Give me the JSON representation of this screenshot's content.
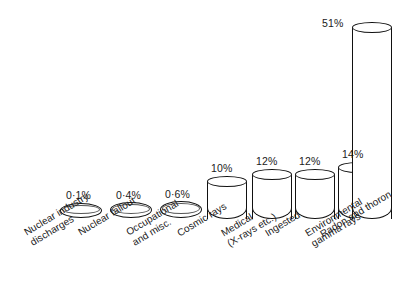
{
  "chart_data": {
    "type": "bar",
    "title": "",
    "subtitle": "",
    "xlabel": "",
    "ylabel": "",
    "ylim": [
      0,
      55
    ],
    "grid": false,
    "legend": "none",
    "value_suffix": "%",
    "categories": [
      "Nuclear industry\ndischarges",
      "Nuclear fallout",
      "Occupational\nand misc.",
      "Cosmic rays",
      "Medical\n(X-rays etc.)",
      "Ingested",
      "Environmental\ngamma rays",
      "Radon and thoron"
    ],
    "values": [
      0.1,
      0.4,
      0.6,
      10,
      12,
      12,
      14,
      51
    ],
    "value_labels": [
      "0·1%",
      "0·4%",
      "0·6%",
      "10%",
      "12%",
      "12%",
      "14%",
      "51%"
    ],
    "style": {
      "bar_shape": "cylinder",
      "fill_color": "#ffffff",
      "outline_color": "#111111",
      "background_color": "#ffffff"
    }
  },
  "bars": [
    {
      "label": "0·1%",
      "category": "Nuclear industry\ndischarges",
      "value": 0.1,
      "x": 60,
      "width": 42,
      "top": 203,
      "bottom": 218,
      "flat": true,
      "value_x": 66,
      "value_y": 190,
      "cat_x": 22,
      "cat_y": 228
    },
    {
      "label": "0·4%",
      "category": "Nuclear fallout",
      "value": 0.4,
      "x": 110,
      "width": 42,
      "top": 202,
      "bottom": 218,
      "flat": true,
      "value_x": 116,
      "value_y": 190,
      "cat_x": 76,
      "cat_y": 228
    },
    {
      "label": "0·6%",
      "category": "Occupational\nand misc.",
      "value": 0.6,
      "x": 160,
      "width": 42,
      "top": 201,
      "bottom": 218,
      "flat": true,
      "value_x": 165,
      "value_y": 189,
      "cat_x": 124,
      "cat_y": 228
    },
    {
      "label": "10%",
      "category": "Cosmic rays",
      "value": 10,
      "x": 207,
      "width": 40,
      "top": 176,
      "bottom": 219,
      "flat": false,
      "value_x": 211,
      "value_y": 163,
      "cat_x": 175,
      "cat_y": 229
    },
    {
      "label": "12%",
      "category": "Medical\n(X-rays etc.)",
      "value": 12,
      "x": 252,
      "width": 40,
      "top": 169,
      "bottom": 219,
      "flat": false,
      "value_x": 256,
      "value_y": 156,
      "cat_x": 219,
      "cat_y": 229
    },
    {
      "label": "12%",
      "category": "Ingested",
      "value": 12,
      "x": 295,
      "width": 40,
      "top": 169,
      "bottom": 219,
      "flat": false,
      "value_x": 299,
      "value_y": 156,
      "cat_x": 263,
      "cat_y": 229
    },
    {
      "label": "14%",
      "category": "Environmental\ngamma rays",
      "value": 14,
      "x": 338,
      "width": 40,
      "top": 162,
      "bottom": 219,
      "flat": false,
      "value_x": 342,
      "value_y": 149,
      "cat_x": 303,
      "cat_y": 229
    },
    {
      "label": "51%",
      "category": "Radon and thoron",
      "value": 51,
      "x": 352,
      "width": 40,
      "top": 22,
      "bottom": 219,
      "flat": false,
      "value_x": 322,
      "value_y": 18,
      "cat_x": 318,
      "cat_y": 230
    }
  ]
}
